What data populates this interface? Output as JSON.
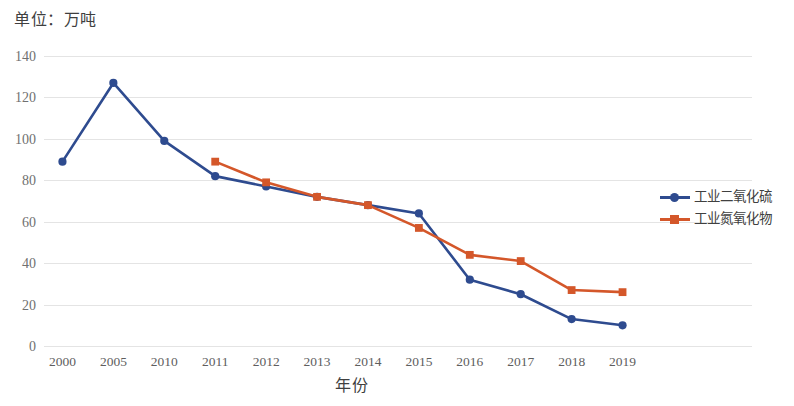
{
  "chart_data": {
    "type": "line",
    "title": "单位：万吨",
    "xlabel": "年份",
    "ylabel": "",
    "categories": [
      "2000",
      "2005",
      "2010",
      "2011",
      "2012",
      "2013",
      "2014",
      "2015",
      "2016",
      "2017",
      "2018",
      "2019"
    ],
    "ylim": [
      0,
      140
    ],
    "ytick_labels": [
      "0",
      "20",
      "40",
      "60",
      "80",
      "100",
      "120",
      "140"
    ],
    "ytick_values": [
      0,
      20,
      40,
      60,
      80,
      100,
      120,
      140
    ],
    "grid": true,
    "legend_position": "right",
    "series": [
      {
        "name": "工业二氧化硫",
        "color": "#2e4b8f",
        "marker": "circle",
        "values": [
          89,
          127,
          99,
          82,
          77,
          72,
          68,
          64,
          32,
          25,
          13,
          10
        ]
      },
      {
        "name": "工业氮氧化物",
        "color": "#d4572a",
        "marker": "square",
        "values": [
          null,
          null,
          null,
          89,
          79,
          72,
          68,
          57,
          44,
          41,
          27,
          26
        ]
      }
    ]
  },
  "legend": {
    "items": [
      {
        "label": "工业二氧化硫",
        "color": "#2e4b8f",
        "marker": "circle"
      },
      {
        "label": "工业氮氧化物",
        "color": "#d4572a",
        "marker": "square"
      }
    ]
  }
}
